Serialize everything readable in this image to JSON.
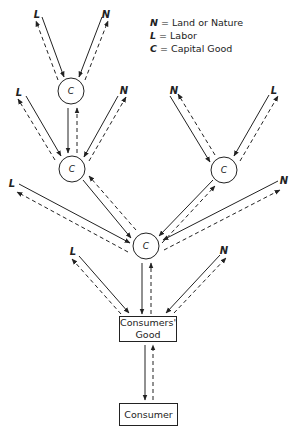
{
  "legend": {
    "items": [
      {
        "symbol": "N",
        "text": "= Land or Nature"
      },
      {
        "symbol": "L",
        "text": "= Labor"
      },
      {
        "symbol": "C",
        "text": "= Capital Good"
      }
    ]
  },
  "nodes": {
    "capital": [
      {
        "id": "c_top",
        "label": "C",
        "x": 71,
        "y": 91
      },
      {
        "id": "c_midleft",
        "label": "C",
        "x": 72,
        "y": 169
      },
      {
        "id": "c_midright",
        "label": "C",
        "x": 224,
        "y": 170
      },
      {
        "id": "c_bottom",
        "label": "C",
        "x": 146,
        "y": 246
      }
    ],
    "factors": [
      {
        "id": "l1",
        "label": "L",
        "x": 37,
        "y": 14
      },
      {
        "id": "n1",
        "label": "N",
        "x": 106,
        "y": 14
      },
      {
        "id": "l2",
        "label": "L",
        "x": 19,
        "y": 92
      },
      {
        "id": "n2",
        "label": "N",
        "x": 124,
        "y": 90
      },
      {
        "id": "n3",
        "label": "N",
        "x": 174,
        "y": 90
      },
      {
        "id": "l3",
        "label": "L",
        "x": 274,
        "y": 90
      },
      {
        "id": "l4",
        "label": "L",
        "x": 12,
        "y": 183
      },
      {
        "id": "n4",
        "label": "N",
        "x": 284,
        "y": 180
      },
      {
        "id": "l5",
        "label": "L",
        "x": 73,
        "y": 251
      },
      {
        "id": "n5",
        "label": "N",
        "x": 224,
        "y": 250
      }
    ],
    "consumers_good": {
      "line1": "Consumers'",
      "line2": "Good"
    },
    "consumer": {
      "label": "Consumer"
    }
  },
  "colors": {
    "ink": "#222222",
    "background": "#ffffff"
  }
}
